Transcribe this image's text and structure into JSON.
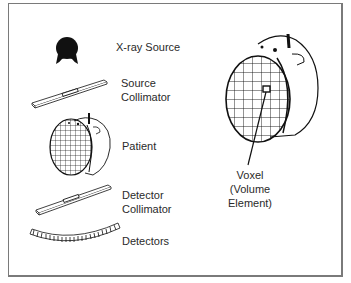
{
  "diagram": {
    "type": "CT scanner schematic",
    "components": [
      {
        "id": "source",
        "label": "X-ray Source"
      },
      {
        "id": "source-collimator",
        "label_line1": "Source",
        "label_line2": "Collimator"
      },
      {
        "id": "patient",
        "label": "Patient"
      },
      {
        "id": "detector-collimator",
        "label_line1": "Detector",
        "label_line2": "Collimator"
      },
      {
        "id": "detectors",
        "label": "Detectors"
      }
    ],
    "callout": {
      "line1": "Voxel",
      "line2": "(Volume",
      "line3": "Element)"
    },
    "colors": {
      "ink": "#111111",
      "border": "#7a7a7a",
      "background": "#ffffff"
    }
  }
}
